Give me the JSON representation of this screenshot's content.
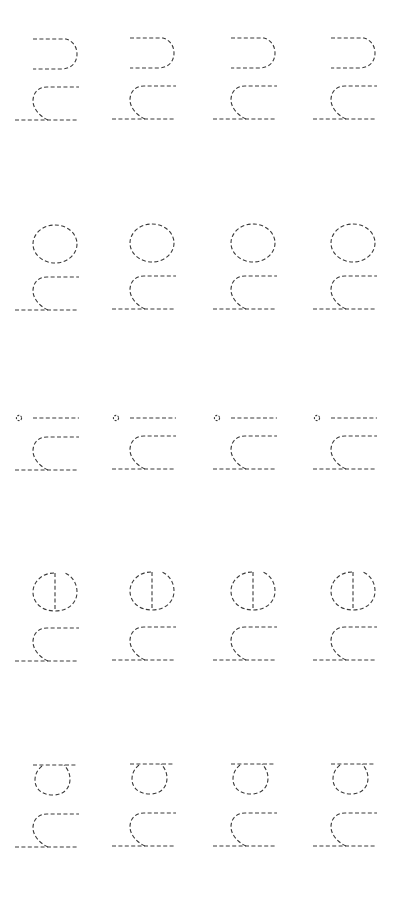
{
  "worksheet": {
    "type": "handwriting-tracing",
    "orientation": "rotated-90",
    "stroke_color": "#3a3a3a",
    "background": "#ffffff",
    "columns": 4,
    "rows": [
      {
        "letters": "hn",
        "upper_glyph": "n",
        "lower_glyph": "h",
        "cells": 4
      },
      {
        "letters": "ho",
        "upper_glyph": "o",
        "lower_glyph": "h",
        "cells": 4
      },
      {
        "letters": "hi",
        "upper_glyph": "i",
        "lower_glyph": "h",
        "cells": 4
      },
      {
        "letters": "he",
        "upper_glyph": "e",
        "lower_glyph": "h",
        "cells": 4
      },
      {
        "letters": "ha",
        "upper_glyph": "a",
        "lower_glyph": "h",
        "cells": 4
      }
    ]
  }
}
